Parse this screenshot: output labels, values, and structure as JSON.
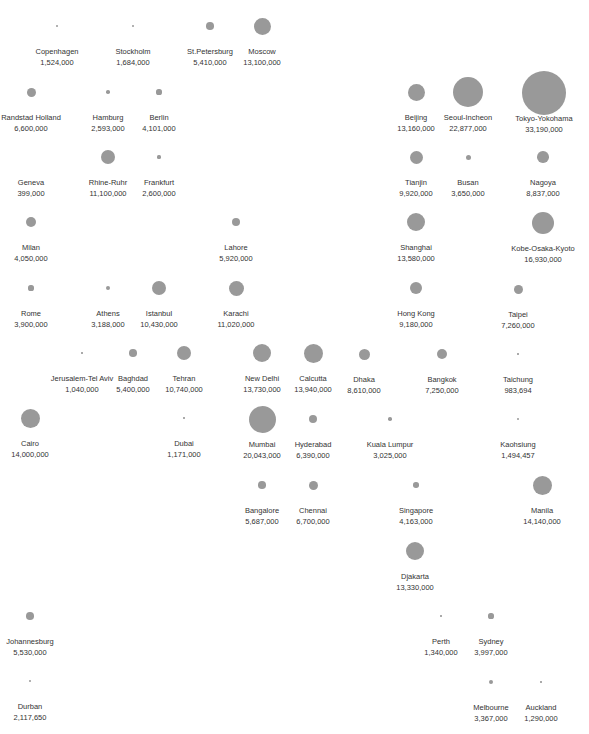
{
  "chart_data": {
    "type": "bubble",
    "title": "",
    "bubble_color": "#999999",
    "text_color": "#333333",
    "series": [
      {
        "name": "Copenhagen",
        "value": 1524000,
        "label": "1,524,000",
        "x": 57,
        "y": 26,
        "r": 1.2
      },
      {
        "name": "Stockholm",
        "value": 1684000,
        "label": "1,684,000",
        "x": 133,
        "y": 26,
        "r": 1.2
      },
      {
        "name": "St.Petersburg",
        "value": 5410000,
        "label": "5,410,000",
        "x": 210,
        "y": 26,
        "r": 3.8
      },
      {
        "name": "Moscow",
        "value": 13100000,
        "label": "13,100,000",
        "x": 262,
        "y": 26,
        "r": 8.5
      },
      {
        "name": "Randstad Holland",
        "value": 6600000,
        "label": "6,600,000",
        "x": 31,
        "y": 92,
        "r": 4.5
      },
      {
        "name": "Hamburg",
        "value": 2593000,
        "label": "2,593,000",
        "x": 108,
        "y": 92,
        "r": 1.8
      },
      {
        "name": "Berlin",
        "value": 4101000,
        "label": "4,101,000",
        "x": 159,
        "y": 92,
        "r": 2.6
      },
      {
        "name": "Beijing",
        "value": 13160000,
        "label": "13,160,000",
        "x": 416,
        "y": 92,
        "r": 8.5
      },
      {
        "name": "Seoul-Incheon",
        "value": 22877000,
        "label": "22,877,000",
        "x": 468,
        "y": 92,
        "r": 15
      },
      {
        "name": "Tokyo-Yokohama",
        "value": 33190000,
        "label": "33,190,000",
        "x": 544,
        "y": 93,
        "r": 22
      },
      {
        "name": "Geneva",
        "value": 399000,
        "label": "399,000",
        "x": 31,
        "y": 157,
        "r": 0
      },
      {
        "name": "Rhine-Ruhr",
        "value": 11100000,
        "label": "11,100,000",
        "x": 108,
        "y": 157,
        "r": 7
      },
      {
        "name": "Frankfurt",
        "value": 2600000,
        "label": "2,600,000",
        "x": 159,
        "y": 157,
        "r": 1.6
      },
      {
        "name": "Tianjin",
        "value": 9920000,
        "label": "9,920,000",
        "x": 416,
        "y": 157,
        "r": 6.5
      },
      {
        "name": "Busan",
        "value": 3650000,
        "label": "3,650,000",
        "x": 468,
        "y": 157,
        "r": 2.5
      },
      {
        "name": "Nagoya",
        "value": 8837000,
        "label": "8,837,000",
        "x": 543,
        "y": 157,
        "r": 5.8
      },
      {
        "name": "Milan",
        "value": 4050000,
        "label": "4,050,000",
        "x": 31,
        "y": 222,
        "r": 5
      },
      {
        "name": "Lahore",
        "value": 5920000,
        "label": "5,920,000",
        "x": 236,
        "y": 222,
        "r": 4
      },
      {
        "name": "Shanghai",
        "value": 13580000,
        "label": "13,580,000",
        "x": 416,
        "y": 222,
        "r": 9
      },
      {
        "name": "Kobe-Osaka-Kyoto",
        "value": 16930000,
        "label": "16,930,000",
        "x": 543,
        "y": 223,
        "r": 11
      },
      {
        "name": "Rome",
        "value": 3900000,
        "label": "3,900,000",
        "x": 31,
        "y": 288,
        "r": 2.6
      },
      {
        "name": "Athens",
        "value": 3188000,
        "label": "3,188,000",
        "x": 108,
        "y": 288,
        "r": 2
      },
      {
        "name": "Istanbul",
        "value": 10430000,
        "label": "10,430,000",
        "x": 159,
        "y": 288,
        "r": 7
      },
      {
        "name": "Karachi",
        "value": 11020000,
        "label": "11,020,000",
        "x": 236,
        "y": 288,
        "r": 7.5
      },
      {
        "name": "Hong Kong",
        "value": 9180000,
        "label": "9,180,000",
        "x": 416,
        "y": 288,
        "r": 6
      },
      {
        "name": "Taipei",
        "value": 7260000,
        "label": "7,260,000",
        "x": 518,
        "y": 289,
        "r": 4.5
      },
      {
        "name": "Jerusalem-Tel Aviv",
        "value": 1040000,
        "label": "1,040,000",
        "x": 82,
        "y": 353,
        "r": 0.8
      },
      {
        "name": "Baghdad",
        "value": 5400000,
        "label": "5,400,000",
        "x": 133,
        "y": 353,
        "r": 3.8
      },
      {
        "name": "Tehran",
        "value": 10740000,
        "label": "10,740,000",
        "x": 184,
        "y": 353,
        "r": 7
      },
      {
        "name": "New Delhi",
        "value": 13730000,
        "label": "13,730,000",
        "x": 262,
        "y": 353,
        "r": 9
      },
      {
        "name": "Calcutta",
        "value": 13940000,
        "label": "13,940,000",
        "x": 313,
        "y": 353,
        "r": 9.5
      },
      {
        "name": "Dhaka",
        "value": 8610000,
        "label": "8,610,000",
        "x": 364,
        "y": 354,
        "r": 5.5
      },
      {
        "name": "Bangkok",
        "value": 7250000,
        "label": "7,250,000",
        "x": 442,
        "y": 354,
        "r": 5
      },
      {
        "name": "Taichung",
        "value": 983694,
        "label": "983,694",
        "x": 518,
        "y": 354,
        "r": 0.8
      },
      {
        "name": "Cairo",
        "value": 14000000,
        "label": "14,000,000",
        "x": 30,
        "y": 418,
        "r": 9.5
      },
      {
        "name": "Dubai",
        "value": 1171000,
        "label": "1,171,000",
        "x": 184,
        "y": 418,
        "r": 0.8
      },
      {
        "name": "Mumbai",
        "value": 20043000,
        "label": "20,043,000",
        "x": 262,
        "y": 419,
        "r": 13.5
      },
      {
        "name": "Hyderabad",
        "value": 6390000,
        "label": "6,390,000",
        "x": 313,
        "y": 419,
        "r": 4.2
      },
      {
        "name": "Kuala Lumpur",
        "value": 3025000,
        "label": "3,025,000",
        "x": 390,
        "y": 419,
        "r": 1.8
      },
      {
        "name": "Kaohsiung",
        "value": 1494457,
        "label": "1,494,457",
        "x": 518,
        "y": 419,
        "r": 1
      },
      {
        "name": "Bangalore",
        "value": 5687000,
        "label": "5,687,000",
        "x": 262,
        "y": 485,
        "r": 3.8
      },
      {
        "name": "Chennai",
        "value": 6700000,
        "label": "6,700,000",
        "x": 313,
        "y": 485,
        "r": 4.5
      },
      {
        "name": "Singapore",
        "value": 4163000,
        "label": "4,163,000",
        "x": 416,
        "y": 485,
        "r": 2.8
      },
      {
        "name": "Manila",
        "value": 14140000,
        "label": "14,140,000",
        "x": 542,
        "y": 485,
        "r": 9.5
      },
      {
        "name": "Djakarta",
        "value": 13330000,
        "label": "13,330,000",
        "x": 415,
        "y": 551,
        "r": 9
      },
      {
        "name": "Johannesburg",
        "value": 5530000,
        "label": "5,530,000",
        "x": 30,
        "y": 616,
        "r": 3.8
      },
      {
        "name": "Perth",
        "value": 1340000,
        "label": "1,340,000",
        "x": 441,
        "y": 616,
        "r": 0.8
      },
      {
        "name": "Sydney",
        "value": 3997000,
        "label": "3,997,000",
        "x": 491,
        "y": 616,
        "r": 2.6
      },
      {
        "name": "Durban",
        "value": 2117650,
        "label": "2,117,650",
        "x": 30,
        "y": 681,
        "r": 1.2
      },
      {
        "name": "Melbourne",
        "value": 3367000,
        "label": "3,367,000",
        "x": 491,
        "y": 682,
        "r": 2.3
      },
      {
        "name": "Auckland",
        "value": 1290000,
        "label": "1,290,000",
        "x": 541,
        "y": 682,
        "r": 0.8
      }
    ]
  }
}
